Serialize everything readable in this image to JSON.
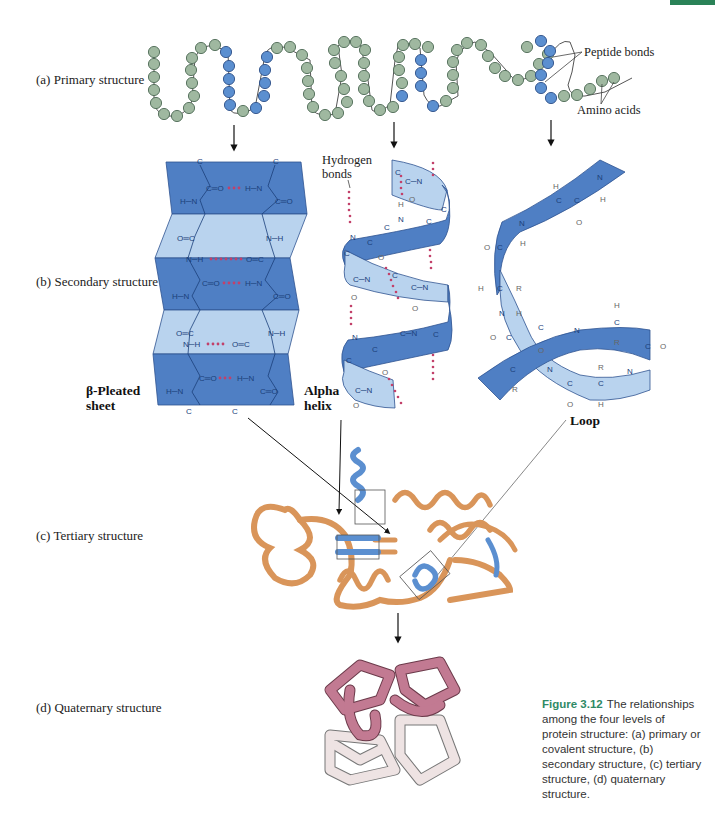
{
  "page": {
    "corner_tab_color": "#2a8257"
  },
  "levels": {
    "primary": {
      "label": "(a) Primary structure"
    },
    "secondary": {
      "label": "(b) Secondary structure"
    },
    "tertiary": {
      "label": "(c) Tertiary structure"
    },
    "quaternary": {
      "label": "(d) Quaternary structure"
    }
  },
  "annotations": {
    "peptide_bonds": "Peptide bonds",
    "amino_acids": "Amino acids",
    "hydrogen_bonds_line1": "Hydrogen",
    "hydrogen_bonds_line2": "bonds",
    "beta_sheet_line1": "β-Pleated",
    "beta_sheet_line2": "sheet",
    "alpha_helix_line1": "Alpha",
    "alpha_helix_line2": "helix",
    "loop": "Loop"
  },
  "caption": {
    "figure_number": "Figure 3.12",
    "text": "The relationships among the four levels of protein structure: (a) primary or covalent structure, (b) secondary structure, (c) tertiary structure, (d) quaternary structure."
  },
  "colors": {
    "residue_green": "#9fb8a0",
    "residue_blue": "#5b8fd0",
    "ribbon_dark_blue": "#4f7fc4",
    "ribbon_light_blue": "#b9d3ee",
    "tertiary_orange": "#d9955a",
    "quaternary_pink": "#c27a92",
    "quaternary_light": "#eee3e3",
    "hbond_dots": "#c2406a"
  }
}
